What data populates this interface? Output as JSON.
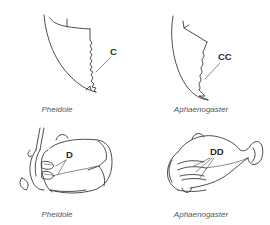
{
  "figure": {
    "panels": [
      {
        "id": "mandible-pheidole",
        "label": "C",
        "caption": "Pheidole"
      },
      {
        "id": "mandible-aphaenogaster",
        "label": "CC",
        "caption": "Aphaenogaster"
      },
      {
        "id": "head-pheidole",
        "label": "D",
        "caption": "Pheidole"
      },
      {
        "id": "head-aphaenogaster",
        "label": "DD",
        "caption": "Aphaenogaster"
      }
    ],
    "colors": {
      "line": "#3a3a3a",
      "caption": "#555555",
      "label": "#2a2a2a",
      "background": "#ffffff"
    }
  }
}
